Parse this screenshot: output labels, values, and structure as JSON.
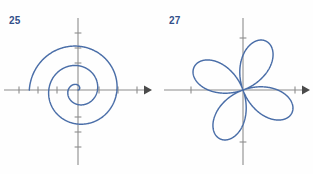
{
  "page": {
    "background_color": "#fefefe",
    "width": 313,
    "height": 174
  },
  "style": {
    "curve_color": "#4a6ea8",
    "axis_color": "#8c8c8c",
    "arrow_color": "#4a4a4a",
    "label_color": "#33508a"
  },
  "figures": [
    {
      "number_label": "25",
      "name": "archimedean-spiral",
      "origin": {
        "x": 78,
        "y": 90
      }
    },
    {
      "number_label": "27",
      "name": "four-petal-rose",
      "origin": {
        "x": 87,
        "y": 90
      }
    }
  ],
  "chart_data": [
    {
      "type": "line",
      "name": "archimedean-spiral",
      "title": "25",
      "curve_family": "polar",
      "equation": "r = a*theta",
      "a": 3.1,
      "theta_range": [
        0,
        15.71
      ],
      "turns": 2.5,
      "xlabel": "",
      "ylabel": "",
      "xlim": [
        -2.6,
        2.6
      ],
      "ylim": [
        -2.6,
        2.6
      ],
      "grid": false,
      "legend": "none",
      "axes": {
        "x_axis": {
          "from_px": 4,
          "to_px": 150,
          "y_px": 90,
          "arrow_end": "right"
        },
        "y_axis": {
          "from_px": 18,
          "to_px": 165,
          "x_px": 78,
          "arrow_end": "none"
        },
        "x_ticks_px": [
          19,
          38,
          57,
          99,
          118,
          137
        ],
        "y_ticks_px": [
          33,
          48,
          63,
          117,
          132,
          147
        ]
      },
      "sample_points_px": [
        {
          "t": 0.0,
          "x": 78.0,
          "y": 90.0
        },
        {
          "t": 1.57,
          "x": 78.0,
          "y": 85.1
        },
        {
          "t": 3.14,
          "x": 68.3,
          "y": 90.0
        },
        {
          "t": 4.71,
          "x": 78.0,
          "y": 104.6
        },
        {
          "t": 6.28,
          "x": 97.5,
          "y": 90.0
        },
        {
          "t": 7.85,
          "x": 78.0,
          "y": 65.6
        },
        {
          "t": 9.42,
          "x": 48.8,
          "y": 90.0
        },
        {
          "t": 10.99,
          "x": 78.0,
          "y": 124.1
        },
        {
          "t": 12.57,
          "x": 117.0,
          "y": 90.0
        },
        {
          "t": 14.14,
          "x": 78.0,
          "y": 46.1
        },
        {
          "t": 15.71,
          "x": 29.3,
          "y": 90.0
        }
      ]
    },
    {
      "type": "line",
      "name": "four-petal-rose",
      "title": "27",
      "curve_family": "polar",
      "equation": "r = a*sin(2*theta)",
      "a": 1.0,
      "rotation_deg": 20,
      "petals": 4,
      "theta_range": [
        0,
        6.283
      ],
      "xlabel": "",
      "ylabel": "",
      "xlim": [
        -1.15,
        1.15
      ],
      "ylim": [
        -1.15,
        1.15
      ],
      "grid": false,
      "legend": "none",
      "axes": {
        "x_axis": {
          "from_px": 8,
          "to_px": 152,
          "y_px": 90,
          "arrow_end": "right"
        },
        "y_axis": {
          "from_px": 18,
          "to_px": 165,
          "x_px": 87,
          "arrow_end": "none"
        },
        "x_ticks_px": [
          35,
          139
        ],
        "y_ticks_px": [
          38,
          142
        ]
      },
      "petal_tips_px": [
        {
          "label": "upper",
          "x": 99,
          "y": 37
        },
        {
          "label": "left",
          "x": 33,
          "y": 67
        },
        {
          "label": "lower",
          "x": 75,
          "y": 143
        },
        {
          "label": "right-lower",
          "x": 141,
          "y": 113
        }
      ]
    }
  ]
}
